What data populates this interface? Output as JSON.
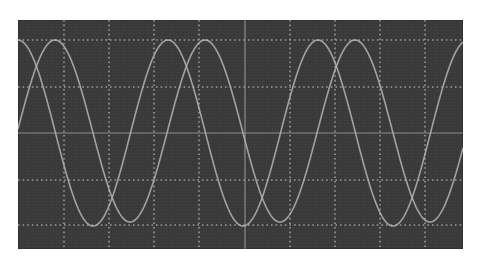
{
  "chart_data": {
    "type": "line",
    "title": "",
    "xlabel": "",
    "ylabel": "",
    "grid": {
      "on": true,
      "vertical_divisions": 10,
      "horizontal_lines_y_px": [
        40,
        87,
        133,
        180,
        225
      ],
      "vertical_lines_x_px": [
        64,
        109,
        154,
        199,
        245,
        290,
        335,
        380,
        425
      ],
      "center_lines_solid": true,
      "other_lines_dotted": true
    },
    "screen_px": {
      "left": 18,
      "top": 20,
      "right": 463,
      "bottom": 249
    },
    "xlim": [
      0,
      3
    ],
    "ylim": [
      -1.25,
      1.25
    ],
    "series": [
      {
        "name": "Trace A",
        "period_px": 150,
        "first_peak_x_px": 18,
        "peak_y_px": 40,
        "trough_y_px": 226,
        "peaks_x_px": [
          18,
          168,
          318,
          468
        ],
        "troughs_x_px": [
          93,
          243,
          393
        ],
        "amplitude": 1.0,
        "phase_deg": 0
      },
      {
        "name": "Trace B",
        "period_px": 150,
        "first_peak_x_px": 55,
        "peak_y_px": 40,
        "trough_y_px": 222,
        "peaks_x_px": [
          55,
          205,
          355
        ],
        "troughs_x_px": [
          130,
          280,
          430
        ],
        "amplitude": 0.98,
        "phase_deg": -89
      }
    ]
  },
  "colors": {
    "screen_background": "#3b3b3b",
    "grid": "#9a9a9a",
    "center_axis": "#8c8c8c",
    "trace": "#b4b4b4",
    "page_background": "#ffffff"
  }
}
